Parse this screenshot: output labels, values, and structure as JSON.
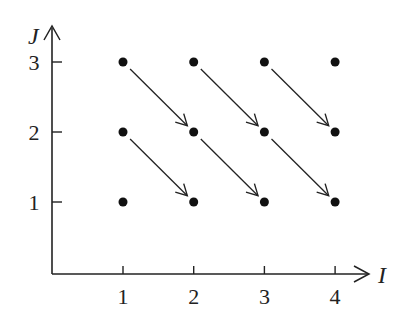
{
  "chart_data": {
    "type": "scatter",
    "title": "",
    "xlabel": "I",
    "ylabel": "J",
    "x_ticks": [
      "1",
      "2",
      "3",
      "4"
    ],
    "y_ticks": [
      "1",
      "2",
      "3"
    ],
    "points": [
      [
        1,
        1
      ],
      [
        2,
        1
      ],
      [
        3,
        1
      ],
      [
        4,
        1
      ],
      [
        1,
        2
      ],
      [
        2,
        2
      ],
      [
        3,
        2
      ],
      [
        4,
        2
      ],
      [
        1,
        3
      ],
      [
        2,
        3
      ],
      [
        3,
        3
      ],
      [
        4,
        3
      ]
    ],
    "arrows": [
      {
        "from": [
          1,
          3
        ],
        "to": [
          2,
          2
        ]
      },
      {
        "from": [
          2,
          3
        ],
        "to": [
          3,
          2
        ]
      },
      {
        "from": [
          3,
          3
        ],
        "to": [
          4,
          2
        ]
      },
      {
        "from": [
          1,
          2
        ],
        "to": [
          2,
          1
        ]
      },
      {
        "from": [
          2,
          2
        ],
        "to": [
          3,
          1
        ]
      },
      {
        "from": [
          3,
          2
        ],
        "to": [
          4,
          1
        ]
      }
    ],
    "grid": false,
    "colors": {
      "ink": "#222222",
      "background": "#ffffff"
    }
  }
}
